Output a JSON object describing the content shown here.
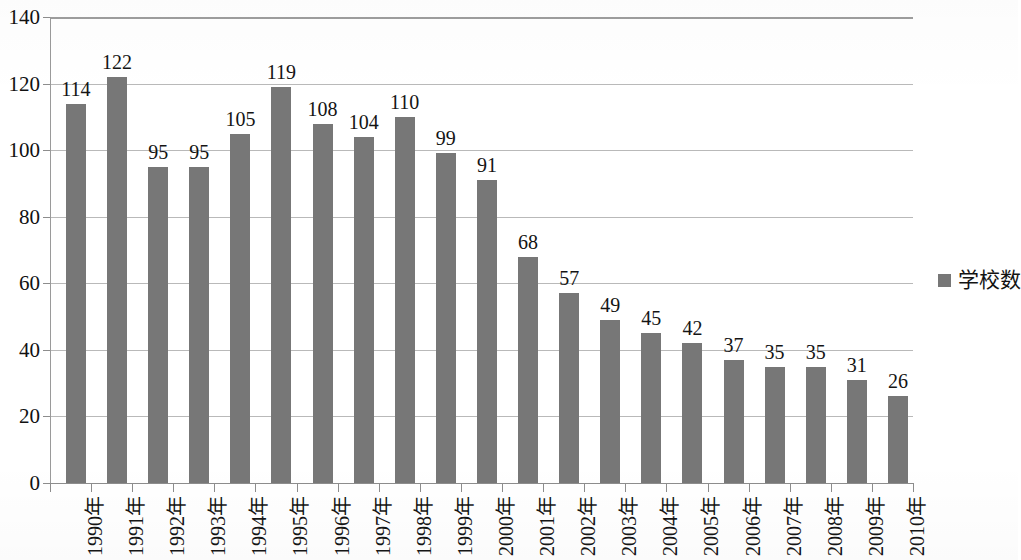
{
  "chart_data": {
    "type": "bar",
    "title": "",
    "xlabel": "",
    "ylabel": "",
    "ylim": [
      0,
      140
    ],
    "ytick_step": 20,
    "grid": true,
    "legend_position": "right",
    "bar_color": "#777777",
    "gridline_color": "#b9b9b9",
    "categories": [
      "1990年",
      "1991年",
      "1992年",
      "1993年",
      "1994年",
      "1995年",
      "1996年",
      "1997年",
      "1998年",
      "1999年",
      "2000年",
      "2001年",
      "2002年",
      "2003年",
      "2004年",
      "2005年",
      "2006年",
      "2007年",
      "2008年",
      "2009年",
      "2010年"
    ],
    "values": [
      114,
      122,
      95,
      95,
      105,
      119,
      108,
      104,
      110,
      99,
      91,
      68,
      57,
      49,
      45,
      42,
      37,
      35,
      35,
      31,
      26
    ],
    "ytick_labels": [
      "0",
      "20",
      "40",
      "60",
      "80",
      "100",
      "120",
      "140"
    ],
    "ytick_values": [
      0,
      20,
      40,
      60,
      80,
      100,
      120,
      140
    ],
    "series": [
      {
        "name": "学校数",
        "values": [
          114,
          122,
          95,
          95,
          105,
          119,
          108,
          104,
          110,
          99,
          91,
          68,
          57,
          49,
          45,
          42,
          37,
          35,
          35,
          31,
          26
        ]
      }
    ]
  },
  "legend": {
    "entries": [
      {
        "label": "学校数",
        "color": "#777777",
        "marker": "square-marker-icon"
      }
    ]
  }
}
